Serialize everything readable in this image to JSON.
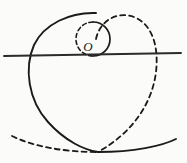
{
  "figure": {
    "background_color": "#fbfbfa",
    "ink_color": "#1a1a1a",
    "width": 187,
    "height": 163,
    "labels": [
      {
        "id": "center-point-label",
        "text": "O",
        "x": 93,
        "y": 46,
        "style": "italic"
      }
    ],
    "elements": {
      "baseline": {
        "name": "horizontal-baseline",
        "style": "solid",
        "x1": 4,
        "y1": 56,
        "x2": 181,
        "y2": 53,
        "stroke_width": 1.8
      },
      "generating_circle": {
        "name": "small-generating-circle",
        "center_x": 93,
        "center_y": 39,
        "radius": 17,
        "left_half_style": "dashed",
        "right_half_style": "solid",
        "stroke_width": 1.6
      },
      "left_large_curve": {
        "name": "solid-spiral-arc",
        "style": "solid",
        "stroke_width": 1.9,
        "path": "M 96 13 C 70 12 44 24 34 45 C 24 68 28 100 48 122 C 66 142 85 150 98 152"
      },
      "right_large_curve": {
        "name": "dashed-spiral-arc",
        "style": "dashed",
        "stroke_width": 1.8,
        "path": "M 96 39 C 100 20 118 11 134 17 C 152 24 159 46 156 72 C 152 104 132 133 98 152"
      },
      "bottom_arc_dashed": {
        "name": "bottom-arc-dashed-half",
        "style": "dashed",
        "stroke_width": 1.8,
        "path": "M 12 136 C 32 146 62 152 98 152"
      },
      "bottom_arc_solid": {
        "name": "bottom-arc-solid-half",
        "style": "solid",
        "stroke_width": 1.9,
        "path": "M 98 152 C 134 152 162 146 176 139"
      }
    }
  }
}
